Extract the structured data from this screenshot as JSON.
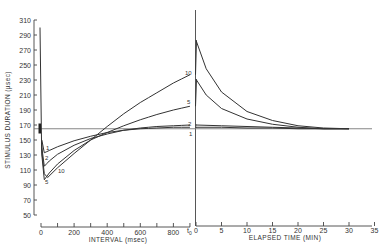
{
  "chart_data": {
    "type": "line",
    "title": "",
    "ylabel": "STIMULUS DURATION (µsec)",
    "ylim": [
      50,
      310
    ],
    "yticks": [
      50,
      70,
      90,
      110,
      130,
      150,
      170,
      190,
      210,
      230,
      250,
      270,
      290,
      310
    ],
    "panels": [
      {
        "name": "interval",
        "xlabel": "INTERVAL (msec)",
        "xlim": [
          0,
          900
        ],
        "xticks": [
          0,
          200,
          400,
          600,
          800
        ],
        "x_end_label": "t0"
      },
      {
        "name": "elapsed",
        "xlabel": "ELAPSED TIME (MIN)",
        "xlim": [
          0,
          35
        ],
        "xticks": [
          0,
          5,
          10,
          15,
          20,
          25,
          30,
          35
        ]
      }
    ],
    "baseline": 165,
    "initial_spike": {
      "x_ms": 0,
      "from": 300,
      "to": 165
    },
    "series": [
      {
        "name": "1",
        "interval": {
          "x": [
            5,
            20,
            50,
            100,
            200,
            300,
            400,
            500,
            600,
            700,
            800,
            900
          ],
          "y": [
            150,
            133,
            136,
            141,
            149,
            155,
            160,
            163,
            165,
            166,
            167,
            167
          ]
        },
        "elapsed": {
          "x": [
            0,
            5,
            10,
            15,
            20,
            25,
            30
          ],
          "y": [
            167,
            167,
            166,
            166,
            165,
            165,
            165
          ]
        }
      },
      {
        "name": "2",
        "interval": {
          "x": [
            5,
            20,
            50,
            100,
            200,
            300,
            400,
            500,
            600,
            700,
            800,
            900
          ],
          "y": [
            140,
            115,
            122,
            131,
            143,
            152,
            158,
            163,
            166,
            168,
            169,
            170
          ]
        },
        "elapsed": {
          "x": [
            0,
            5,
            10,
            15,
            20,
            25,
            30
          ],
          "y": [
            170,
            169,
            168,
            167,
            166,
            165,
            165
          ]
        }
      },
      {
        "name": "5",
        "interval": {
          "x": [
            5,
            20,
            50,
            100,
            200,
            300,
            400,
            500,
            600,
            700,
            800,
            900
          ],
          "y": [
            130,
            97,
            106,
            118,
            136,
            150,
            160,
            169,
            177,
            184,
            190,
            195
          ]
        },
        "elapsed": {
          "x": [
            0,
            2,
            5,
            10,
            15,
            20,
            25,
            30
          ],
          "y": [
            231,
            210,
            192,
            178,
            171,
            167,
            165,
            165
          ]
        }
      },
      {
        "name": "10",
        "interval": {
          "x": [
            5,
            20,
            40,
            100,
            200,
            300,
            400,
            500,
            600,
            700,
            800,
            900
          ],
          "y": [
            135,
            105,
            100,
            113,
            132,
            150,
            168,
            185,
            200,
            213,
            226,
            237
          ]
        },
        "elapsed": {
          "x": [
            0,
            2,
            5,
            10,
            15,
            20,
            25,
            30
          ],
          "y": [
            283,
            245,
            214,
            188,
            176,
            169,
            166,
            165
          ]
        }
      }
    ],
    "legend": "inline curve labels: 1, 2, 5, 10",
    "grid": false
  },
  "labels": {
    "ylabel": "STIMULUS DURATION (µsec)",
    "xlabel_left": "INTERVAL (msec)",
    "xlabel_right": "ELAPSED TIME (MIN)",
    "t0": "t",
    "t0_sub": "0",
    "yticks": [
      "310",
      "290",
      "270",
      "250",
      "230",
      "210",
      "190",
      "170",
      "150",
      "130",
      "110",
      "90",
      "70",
      "50"
    ],
    "xticks_left": [
      "0",
      "200",
      "400",
      "600",
      "800"
    ],
    "xticks_right": [
      "0",
      "5",
      "10",
      "15",
      "20",
      "25",
      "30",
      "35"
    ],
    "curve_1": "1",
    "curve_2": "2",
    "curve_5": "5",
    "curve_10": "10"
  }
}
